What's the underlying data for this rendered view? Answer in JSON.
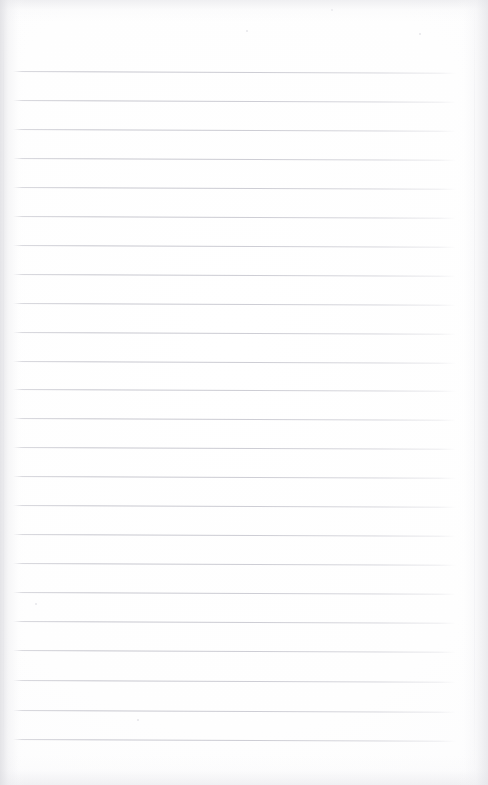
{
  "document": {
    "type": "scanned-notebook-page",
    "title": "Blank ruled notebook page",
    "description": "A scanned blank sheet of lined notebook paper with no handwriting or printed text",
    "page_text": "",
    "background_color": "#ffffff",
    "paper_tone": "#fdfdfe",
    "rule_color": "#c8c8d0",
    "edge_shadow_color": "#e4e4e8"
  },
  "geometry": {
    "width": 488,
    "height": 785,
    "rule_left_x": 12,
    "rule_right_x": 456,
    "first_rule_y": 71,
    "rule_spacing": 29.0,
    "rule_count": 24,
    "rule_thickness": 1,
    "rule_tilt_deg": 0.22
  },
  "rules": [
    {
      "index": 1,
      "y": 71,
      "x_start": 13,
      "x_end": 456
    },
    {
      "index": 2,
      "y": 100,
      "x_start": 13,
      "x_end": 456
    },
    {
      "index": 3,
      "y": 129,
      "x_start": 13,
      "x_end": 456
    },
    {
      "index": 4,
      "y": 158,
      "x_start": 13,
      "x_end": 456
    },
    {
      "index": 5,
      "y": 187,
      "x_start": 13,
      "x_end": 456
    },
    {
      "index": 6,
      "y": 216,
      "x_start": 13,
      "x_end": 456
    },
    {
      "index": 7,
      "y": 245,
      "x_start": 13,
      "x_end": 456
    },
    {
      "index": 8,
      "y": 274,
      "x_start": 13,
      "x_end": 456
    },
    {
      "index": 9,
      "y": 303,
      "x_start": 13,
      "x_end": 456
    },
    {
      "index": 10,
      "y": 332,
      "x_start": 13,
      "x_end": 456
    },
    {
      "index": 11,
      "y": 361,
      "x_start": 13,
      "x_end": 456
    },
    {
      "index": 12,
      "y": 389,
      "x_start": 13,
      "x_end": 456
    },
    {
      "index": 13,
      "y": 418,
      "x_start": 13,
      "x_end": 456
    },
    {
      "index": 14,
      "y": 447,
      "x_start": 13,
      "x_end": 456
    },
    {
      "index": 15,
      "y": 476,
      "x_start": 13,
      "x_end": 456
    },
    {
      "index": 16,
      "y": 505,
      "x_start": 13,
      "x_end": 456
    },
    {
      "index": 17,
      "y": 534,
      "x_start": 13,
      "x_end": 456
    },
    {
      "index": 18,
      "y": 563,
      "x_start": 13,
      "x_end": 456
    },
    {
      "index": 19,
      "y": 592,
      "x_start": 13,
      "x_end": 456
    },
    {
      "index": 20,
      "y": 621,
      "x_start": 13,
      "x_end": 456
    },
    {
      "index": 21,
      "y": 650,
      "x_start": 13,
      "x_end": 456
    },
    {
      "index": 22,
      "y": 680,
      "x_start": 13,
      "x_end": 456
    },
    {
      "index": 23,
      "y": 710,
      "x_start": 13,
      "x_end": 456
    },
    {
      "index": 24,
      "y": 739,
      "x_start": 13,
      "x_end": 456
    }
  ],
  "specks": [
    {
      "x": 35,
      "y": 603,
      "size": 2
    },
    {
      "x": 137,
      "y": 719,
      "size": 2
    },
    {
      "x": 246,
      "y": 30,
      "size": 2
    },
    {
      "x": 419,
      "y": 33,
      "size": 2
    },
    {
      "x": 331,
      "y": 9,
      "size": 2
    }
  ]
}
